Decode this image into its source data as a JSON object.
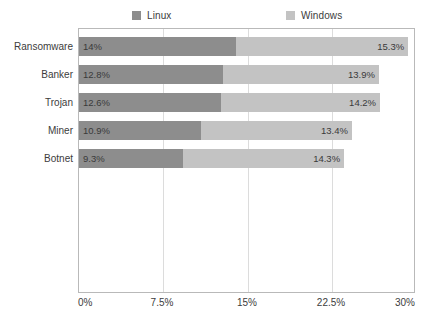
{
  "chart_data": {
    "type": "bar",
    "orientation": "horizontal",
    "stacked": true,
    "title": "",
    "subtitle": "",
    "xlabel": "",
    "ylabel": "",
    "categories": [
      "Ransomware",
      "Banker",
      "Trojan",
      "Miner",
      "Botnet"
    ],
    "series": [
      {
        "name": "Linux",
        "color": "#8d8d8d",
        "values": [
          14,
          12.8,
          12.6,
          10.9,
          9.3
        ],
        "labels": [
          "14%",
          "12.8%",
          "12.6%",
          "10.9%",
          "9.3%"
        ]
      },
      {
        "name": "Windows",
        "color": "#c3c3c3",
        "values": [
          15.3,
          13.9,
          14.2,
          13.4,
          14.3
        ],
        "labels": [
          "15.3%",
          "13.9%",
          "14.2%",
          "13.4%",
          "14.3%"
        ]
      }
    ],
    "totals": [
      29.3,
      26.7,
      26.8,
      24.3,
      23.6
    ],
    "xlim": [
      0,
      30
    ],
    "xticks": [
      0,
      7.5,
      15,
      22.5,
      30
    ],
    "xticklabels": [
      "0%",
      "7.5%",
      "15%",
      "22.5%",
      "30%"
    ],
    "gridlines": [
      7.5,
      15,
      22.5
    ],
    "grid": true,
    "legend_position": "top"
  },
  "legend": {
    "entries": [
      {
        "label": "Linux",
        "color": "#8d8d8d"
      },
      {
        "label": "Windows",
        "color": "#c3c3c3"
      }
    ]
  },
  "axis": {
    "tick_labels": [
      "0%",
      "7.5%",
      "15%",
      "22.5%",
      "30%"
    ],
    "category_labels": [
      "Ransomware",
      "Banker",
      "Trojan",
      "Miner",
      "Botnet"
    ]
  },
  "colors": {
    "linux": "#8d8d8d",
    "windows": "#c3c3c3",
    "grid": "#dcdcdc",
    "frame": "#b9b9b9",
    "text": "#3c3c3c",
    "background": "#ffffff"
  }
}
